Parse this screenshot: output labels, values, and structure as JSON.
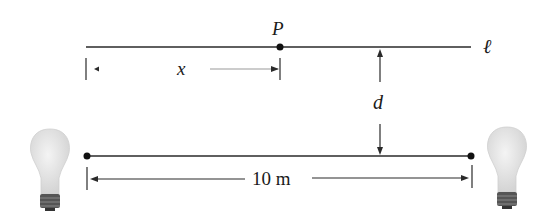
{
  "diagram": {
    "point_label": "P",
    "line_label": "ℓ",
    "x_label": "x",
    "d_label": "d",
    "distance_label": "10 m",
    "colors": {
      "line": "#2a2a2a",
      "bulb_glass": "#e6e6e6",
      "bulb_base": "#555555",
      "label": "#1a1a1a"
    }
  }
}
